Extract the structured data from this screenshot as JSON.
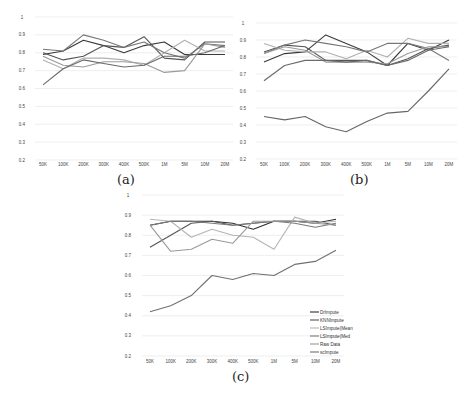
{
  "chart_data": [
    {
      "id": "a",
      "type": "line",
      "caption": "(a)",
      "categories": [
        "50K",
        "100K",
        "200K",
        "300K",
        "400K",
        "500K",
        "1M",
        "5M",
        "10M",
        "20M"
      ],
      "yticks": [
        "1",
        "0.9",
        "0.8",
        "0.7",
        "0.6",
        "0.5",
        "0.4",
        "0.3",
        "0.2"
      ],
      "ylim": [
        0.2,
        1.0
      ],
      "grid": true,
      "series": [
        {
          "name": "DrImpute",
          "color": "#3a3a3a",
          "values": [
            0.79,
            0.81,
            0.87,
            0.84,
            0.8,
            0.84,
            0.86,
            0.79,
            0.79,
            0.79
          ]
        },
        {
          "name": "KNNImpute",
          "color": "#555555",
          "values": [
            0.8,
            0.76,
            0.78,
            0.84,
            0.83,
            0.89,
            0.77,
            0.76,
            0.86,
            0.86
          ]
        },
        {
          "name": "LSImpute(Mean",
          "color": "#b0b0b0",
          "values": [
            0.76,
            0.71,
            0.77,
            0.77,
            0.76,
            0.73,
            0.8,
            0.87,
            0.81,
            0.81
          ]
        },
        {
          "name": "LSImpute(Med",
          "color": "#777777",
          "values": [
            0.82,
            0.81,
            0.9,
            0.87,
            0.83,
            0.86,
            0.8,
            0.77,
            0.85,
            0.84
          ]
        },
        {
          "name": "Raw Data",
          "color": "#9a9a9a",
          "values": [
            0.78,
            0.73,
            0.72,
            0.75,
            0.75,
            0.74,
            0.69,
            0.7,
            0.85,
            0.83
          ]
        },
        {
          "name": "scImpute",
          "color": "#6a6a6a",
          "values": [
            0.62,
            0.71,
            0.76,
            0.74,
            0.72,
            0.73,
            0.78,
            0.78,
            0.8,
            0.84
          ]
        }
      ]
    },
    {
      "id": "b",
      "type": "line",
      "caption": "(b)",
      "categories": [
        "50K",
        "100K",
        "200K",
        "300K",
        "400K",
        "500K",
        "1M",
        "5M",
        "10M",
        "20M"
      ],
      "yticks": [
        "1",
        "0.9",
        "0.8",
        "0.7",
        "0.6",
        "0.5",
        "0.4",
        "0.3",
        "0.2"
      ],
      "ylim": [
        0.2,
        1.0
      ],
      "grid": true,
      "series": [
        {
          "name": "DrImpute",
          "color": "#3a3a3a",
          "values": [
            0.77,
            0.82,
            0.83,
            0.93,
            0.88,
            0.83,
            0.75,
            0.88,
            0.84,
            0.9
          ]
        },
        {
          "name": "KNNImpute",
          "color": "#555555",
          "values": [
            0.83,
            0.87,
            0.86,
            0.78,
            0.78,
            0.78,
            0.75,
            0.79,
            0.85,
            0.87
          ]
        },
        {
          "name": "LSImpute(Mean",
          "color": "#b0b0b0",
          "values": [
            0.88,
            0.84,
            0.83,
            0.83,
            0.79,
            0.84,
            0.8,
            0.91,
            0.88,
            0.88
          ]
        },
        {
          "name": "LSImpute(Med",
          "color": "#777777",
          "values": [
            0.82,
            0.87,
            0.9,
            0.88,
            0.86,
            0.83,
            0.88,
            0.88,
            0.85,
            0.78
          ]
        },
        {
          "name": "Raw Data",
          "color": "#9a9a9a",
          "values": [
            0.82,
            0.86,
            0.84,
            0.77,
            0.77,
            0.77,
            0.76,
            0.82,
            0.86,
            0.86
          ]
        },
        {
          "name": "scImpute",
          "color": "#6a6a6a",
          "values": [
            0.66,
            0.75,
            0.78,
            0.78,
            0.77,
            0.78,
            0.75,
            0.78,
            0.84,
            0.86
          ]
        },
        {
          "name": "scImpute-low",
          "color": "#666666",
          "values": [
            0.45,
            0.43,
            0.45,
            0.39,
            0.36,
            0.42,
            0.47,
            0.48,
            0.6,
            0.73
          ]
        }
      ]
    },
    {
      "id": "c",
      "type": "line",
      "caption": "(c)",
      "categories": [
        "50K",
        "100K",
        "200K",
        "300K",
        "400K",
        "500K",
        "1M",
        "5M",
        "10M",
        "20M"
      ],
      "yticks": [
        "1",
        "0.9",
        "0.8",
        "0.7",
        "0.6",
        "0.5",
        "0.4",
        "0.3",
        "0.2"
      ],
      "ylim": [
        0.2,
        1.0
      ],
      "grid": true,
      "legend": {
        "position": "lower right",
        "entries": [
          "DrImpute",
          "KNNImpute",
          "LSImpute(Mean",
          "LSImpute(Med",
          "Raw Data",
          "scImpute"
        ]
      },
      "series": [
        {
          "name": "DrImpute",
          "color": "#2e2e2e",
          "values": [
            0.85,
            0.87,
            0.87,
            0.87,
            0.86,
            0.83,
            0.87,
            0.87,
            0.86,
            0.88
          ]
        },
        {
          "name": "KNNImpute",
          "color": "#555555",
          "values": [
            0.74,
            0.8,
            0.86,
            0.87,
            0.85,
            0.86,
            0.87,
            0.87,
            0.87,
            0.85
          ]
        },
        {
          "name": "LSImpute(Mean",
          "color": "#b5b5b5",
          "values": [
            0.88,
            0.87,
            0.79,
            0.83,
            0.8,
            0.79,
            0.73,
            0.89,
            0.86,
            0.87
          ]
        },
        {
          "name": "LSImpute(Med",
          "color": "#7a7a7a",
          "values": [
            0.85,
            0.87,
            0.87,
            0.86,
            0.85,
            0.86,
            0.87,
            0.86,
            0.84,
            0.86
          ]
        },
        {
          "name": "Raw Data",
          "color": "#9a9a9a",
          "values": [
            0.85,
            0.72,
            0.73,
            0.78,
            0.76,
            0.87,
            0.87,
            0.87,
            0.86,
            0.85
          ]
        },
        {
          "name": "scImpute",
          "color": "#707070",
          "values": [
            0.42,
            0.45,
            0.5,
            0.6,
            0.58,
            0.61,
            0.6,
            0.655,
            0.67,
            0.725
          ]
        }
      ]
    }
  ]
}
